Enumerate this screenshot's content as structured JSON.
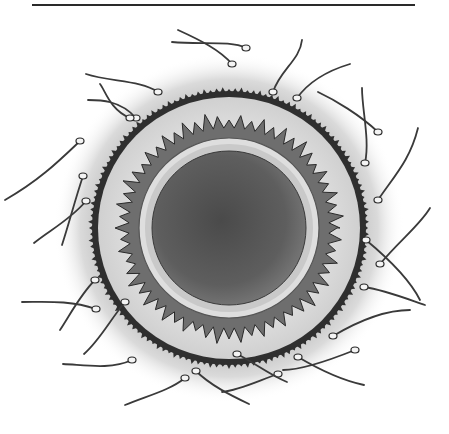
{
  "figure": {
    "alt": "Illustration of an egg cell (ovum) surrounded by sperm cells",
    "colors": {
      "background": "#ffffff",
      "halo": "#c8c8c8",
      "corona_fill": "#e2e2e2",
      "outer_ring": "#3a3a3a",
      "zona_dark": "#6a6a6a",
      "membrane_light": "#d8d8d8",
      "cytoplasm": "#5c5c5c",
      "sperm": "#3a3a3a"
    },
    "center": [
      229,
      228
    ],
    "radii": {
      "halo": 160,
      "outer_ring": 136,
      "zona_jagged": 112,
      "membrane": 89,
      "cytoplasm": 76
    },
    "sperm": [
      {
        "head": [
          232,
          64
        ],
        "tail": "M232,64 C220,50 200,40 178,30"
      },
      {
        "head": [
          246,
          48
        ],
        "tail": "M246,48 C230,40 200,45 172,42"
      },
      {
        "head": [
          273,
          92
        ],
        "tail": "M273,92 C280,70 300,60 302,40"
      },
      {
        "head": [
          297,
          98
        ],
        "tail": "M297,98 C310,80 330,70 350,64"
      },
      {
        "head": [
          158,
          92
        ],
        "tail": "M158,92 C140,80 110,82 86,74"
      },
      {
        "head": [
          136,
          118
        ],
        "tail": "M136,118 C120,100 100,100 88,100"
      },
      {
        "head": [
          130,
          118
        ],
        "tail": "M130,118 C110,110 105,90 100,84"
      },
      {
        "head": [
          80,
          141
        ],
        "tail": "M80,141 C60,160 40,180 5,200"
      },
      {
        "head": [
          83,
          176
        ],
        "tail": "M83,176 C75,200 70,220 62,245"
      },
      {
        "head": [
          86,
          201
        ],
        "tail": "M86,201 C70,220 50,230 34,243"
      },
      {
        "head": [
          378,
          132
        ],
        "tail": "M378,132 C360,115 335,100 318,92"
      },
      {
        "head": [
          365,
          163
        ],
        "tail": "M365,163 C370,140 362,110 362,88"
      },
      {
        "head": [
          378,
          200
        ],
        "tail": "M378,200 C395,175 410,160 418,128"
      },
      {
        "head": [
          380,
          264
        ],
        "tail": "M380,264 C400,240 420,225 430,208"
      },
      {
        "head": [
          366,
          240
        ],
        "tail": "M366,240 C390,260 410,280 420,300"
      },
      {
        "head": [
          364,
          287
        ],
        "tail": "M364,287 C385,290 410,300 425,305"
      },
      {
        "head": [
          333,
          336
        ],
        "tail": "M333,336 C360,320 385,310 410,310"
      },
      {
        "head": [
          355,
          350
        ],
        "tail": "M355,350 C330,360 300,370 283,370"
      },
      {
        "head": [
          298,
          357
        ],
        "tail": "M298,357 C320,370 340,380 364,385"
      },
      {
        "head": [
          278,
          374
        ],
        "tail": "M278,374 C260,380 240,390 222,392"
      },
      {
        "head": [
          237,
          354
        ],
        "tail": "M237,354 C250,360 270,375 287,382"
      },
      {
        "head": [
          196,
          371
        ],
        "tail": "M196,371 C210,385 230,395 249,404"
      },
      {
        "head": [
          185,
          378
        ],
        "tail": "M185,378 C170,390 150,395 125,405"
      },
      {
        "head": [
          95,
          280
        ],
        "tail": "M95,280 C80,295 70,315 60,330"
      },
      {
        "head": [
          96,
          309
        ],
        "tail": "M96,309 C70,300 45,302 22,302"
      },
      {
        "head": [
          125,
          302
        ],
        "tail": "M125,302 C110,320 100,340 84,354"
      },
      {
        "head": [
          132,
          360
        ],
        "tail": "M132,360 C110,370 85,365 63,364"
      }
    ]
  }
}
